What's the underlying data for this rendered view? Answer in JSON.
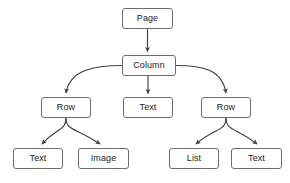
{
  "diagram": {
    "type": "tree",
    "background_color": "#ffffff",
    "node_fill_color": "#ffffff",
    "node_border_color": "#6e6e6e",
    "edge_color": "#3f3f3f",
    "label_color": "#1b1b1b",
    "nodes": [
      {
        "id": "page",
        "label": "Page",
        "level": 0,
        "x": 122,
        "y": 8,
        "w": 51,
        "h": 21
      },
      {
        "id": "column",
        "label": "Column",
        "level": 1,
        "x": 122,
        "y": 55,
        "w": 54,
        "h": 21
      },
      {
        "id": "row1",
        "label": "Row",
        "level": 2,
        "x": 41,
        "y": 97,
        "w": 50,
        "h": 21
      },
      {
        "id": "text1",
        "label": "Text",
        "level": 2,
        "x": 123,
        "y": 97,
        "w": 50,
        "h": 21
      },
      {
        "id": "row2",
        "label": "Row",
        "level": 2,
        "x": 201,
        "y": 97,
        "w": 50,
        "h": 21
      },
      {
        "id": "text2",
        "label": "Text",
        "level": 3,
        "x": 13,
        "y": 148,
        "w": 50,
        "h": 21
      },
      {
        "id": "image1",
        "label": "Image",
        "level": 3,
        "x": 78,
        "y": 148,
        "w": 51,
        "h": 21
      },
      {
        "id": "list1",
        "label": "List",
        "level": 3,
        "x": 169,
        "y": 148,
        "w": 50,
        "h": 21
      },
      {
        "id": "text3",
        "label": "Text",
        "level": 3,
        "x": 231,
        "y": 148,
        "w": 51,
        "h": 21
      }
    ],
    "edges": [
      {
        "from": "page",
        "to": "column",
        "shape": "straight",
        "arrow": true
      },
      {
        "from": "column",
        "to": "row1",
        "shape": "curved",
        "arrow": true
      },
      {
        "from": "column",
        "to": "text1",
        "shape": "straight",
        "arrow": true
      },
      {
        "from": "column",
        "to": "row2",
        "shape": "curved",
        "arrow": true
      },
      {
        "from": "row1",
        "to": "text2",
        "shape": "curved",
        "arrow": true
      },
      {
        "from": "row1",
        "to": "image1",
        "shape": "curved",
        "arrow": true
      },
      {
        "from": "row2",
        "to": "list1",
        "shape": "curved",
        "arrow": true
      },
      {
        "from": "row2",
        "to": "text3",
        "shape": "curved",
        "arrow": true
      }
    ]
  }
}
